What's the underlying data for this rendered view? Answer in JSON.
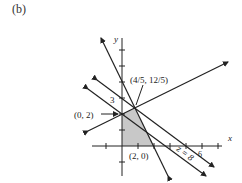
{
  "figure": {
    "panel_label": "(b)",
    "axes": {
      "x_label": "x",
      "y_label": "y",
      "y_tick_label": "3",
      "x_tick_label": "6"
    },
    "points": [
      {
        "label": "(0, 2)",
        "x": 0,
        "y": 2
      },
      {
        "label": "(4/5, 12/5)",
        "x": 0.8,
        "y": 2.4
      },
      {
        "label": "(2, 0)",
        "x": 2,
        "y": 0
      }
    ],
    "objective_line_label": "z = 8",
    "colors": {
      "region_fill": "#c8c8c8",
      "line": "#222222"
    }
  }
}
